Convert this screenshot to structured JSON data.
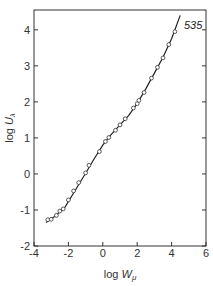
{
  "chart_data": {
    "type": "scatter",
    "title": "",
    "xlabel": "log W_μ",
    "ylabel": "log U_λ",
    "xlabel_parts": {
      "base": "log ",
      "sym": "W",
      "sub": "μ"
    },
    "ylabel_parts": {
      "base": "log ",
      "sym": "U",
      "sub": "λ"
    },
    "xlim": [
      -4,
      6
    ],
    "ylim": [
      -2,
      4.4
    ],
    "xticks": [
      -4,
      -2,
      0,
      2,
      4,
      6
    ],
    "yticks": [
      -2,
      -1,
      0,
      1,
      2,
      3,
      4
    ],
    "grid": false,
    "legend": null,
    "annotations": [
      {
        "text": "535",
        "x": 4.6,
        "y": 4.0
      }
    ],
    "series": [
      {
        "name": "535",
        "marker": "open-circle",
        "points": [
          [
            -3.2,
            -1.27
          ],
          [
            -3.0,
            -1.26
          ],
          [
            -2.7,
            -1.15
          ],
          [
            -2.5,
            -1.03
          ],
          [
            -2.3,
            -0.97
          ],
          [
            -2.0,
            -0.72
          ],
          [
            -1.7,
            -0.47
          ],
          [
            -1.4,
            -0.24
          ],
          [
            -1.0,
            0.03
          ],
          [
            -0.8,
            0.24
          ],
          [
            -0.2,
            0.62
          ],
          [
            0.15,
            0.9
          ],
          [
            0.35,
            1.01
          ],
          [
            0.74,
            1.21
          ],
          [
            1.0,
            1.36
          ],
          [
            1.3,
            1.53
          ],
          [
            1.78,
            1.83
          ],
          [
            2.0,
            1.95
          ],
          [
            2.1,
            2.04
          ],
          [
            2.4,
            2.26
          ],
          [
            2.83,
            2.66
          ],
          [
            3.18,
            2.96
          ],
          [
            3.5,
            3.22
          ],
          [
            3.84,
            3.59
          ],
          [
            4.19,
            3.95
          ]
        ],
        "fit_line": [
          [
            -3.3,
            -1.35
          ],
          [
            -2.8,
            -1.18
          ],
          [
            -2.2,
            -0.92
          ],
          [
            -1.6,
            -0.45
          ],
          [
            -1.0,
            0.02
          ],
          [
            -0.5,
            0.42
          ],
          [
            0.0,
            0.8
          ],
          [
            0.4,
            1.05
          ],
          [
            1.0,
            1.36
          ],
          [
            1.5,
            1.62
          ],
          [
            2.0,
            1.96
          ],
          [
            2.5,
            2.36
          ],
          [
            3.0,
            2.8
          ],
          [
            3.5,
            3.24
          ],
          [
            4.0,
            3.75
          ],
          [
            4.5,
            4.4
          ]
        ]
      }
    ]
  }
}
